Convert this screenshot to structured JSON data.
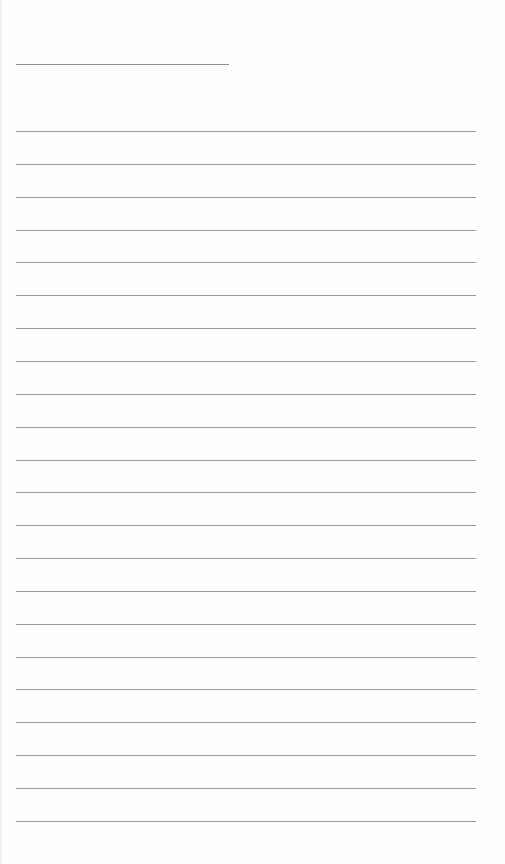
{
  "document": {
    "type": "lined-paper",
    "background_color": "#fefefe",
    "line_color": "#9a9a9a",
    "header_line": {
      "x": 16,
      "y": 64,
      "width": 213
    },
    "ruled_lines": {
      "count": 22,
      "start_y": 131,
      "spacing": 32.85,
      "x": 16,
      "width": 460
    }
  }
}
